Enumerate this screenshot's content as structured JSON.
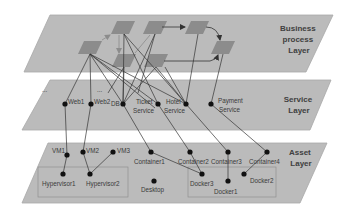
{
  "colors": {
    "plane": "#b9b9b9",
    "plane_edge": "#a6a6a6",
    "process_box": "#8c8c8c",
    "node": "#111111",
    "edge": "#333333",
    "group_border": "#8a8a8a"
  },
  "layers": {
    "business": {
      "title_lines": [
        "Business",
        "process",
        "Layer"
      ]
    },
    "service": {
      "title_lines": [
        "Service",
        "Layer"
      ]
    },
    "asset": {
      "title_lines": [
        "Asset",
        "Layer"
      ]
    }
  },
  "service_nodes": [
    {
      "id": "web1",
      "label": "Web1"
    },
    {
      "id": "web2",
      "label": "Web2"
    },
    {
      "id": "db",
      "label": "DB"
    },
    {
      "id": "ticket",
      "label_lines": [
        "Ticket",
        "Service"
      ]
    },
    {
      "id": "hotel",
      "label_lines": [
        "Hotel",
        "Service"
      ]
    },
    {
      "id": "payment",
      "label_lines": [
        "Payment",
        "Service"
      ]
    }
  ],
  "service_ellipsis": [
    "...",
    "..."
  ],
  "asset_nodes": [
    {
      "id": "vm1",
      "label": "VM1"
    },
    {
      "id": "vm2",
      "label": "VM2"
    },
    {
      "id": "vm3",
      "label": "VM3"
    },
    {
      "id": "container1",
      "label": "Container1"
    },
    {
      "id": "container2",
      "label": "Container2"
    },
    {
      "id": "container3",
      "label": "Container3"
    },
    {
      "id": "container4",
      "label": "Container4"
    },
    {
      "id": "hypervisor1",
      "label": "Hypervisor1"
    },
    {
      "id": "hypervisor2",
      "label": "Hypervisor2"
    },
    {
      "id": "desktop",
      "label": "Desktop"
    },
    {
      "id": "docker3",
      "label": "Docker3"
    },
    {
      "id": "docker1",
      "label": "Docker1"
    },
    {
      "id": "docker2",
      "label": "Docker2"
    }
  ]
}
